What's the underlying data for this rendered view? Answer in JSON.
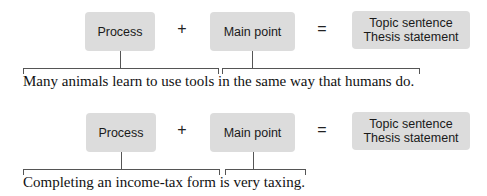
{
  "diagrams": [
    {
      "process_label": "Process",
      "plus_symbol": "+",
      "main_point_label": "Main point",
      "equals_symbol": "=",
      "result_line1": "Topic sentence",
      "result_line2": "Thesis statement",
      "sentence": "Many animals learn to use tools in the same way that humans do.",
      "process_span": "Many animals learn to use tools",
      "main_point_span": "in the same way that humans do."
    },
    {
      "process_label": "Process",
      "plus_symbol": "+",
      "main_point_label": "Main point",
      "equals_symbol": "=",
      "result_line1": "Topic sentence",
      "result_line2": "Thesis statement",
      "sentence": "Completing an income-tax form is very taxing.",
      "process_span": "Completing an income-tax form",
      "main_point_span": "is very taxing."
    }
  ]
}
